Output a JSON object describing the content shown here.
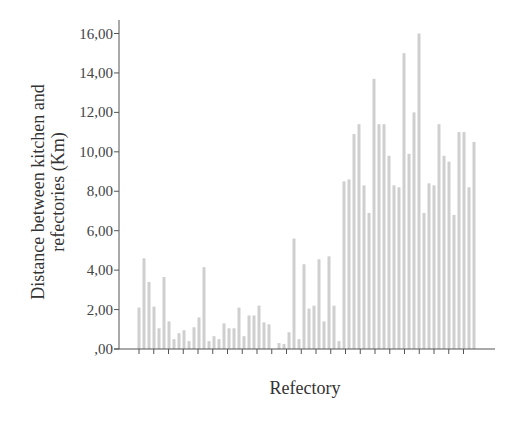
{
  "chart_data": {
    "type": "bar",
    "title": "",
    "xlabel": "Refectory",
    "ylabel_lines": [
      "Distance between kitchen and",
      "refectories (Km)"
    ],
    "ylabel": "Distance between kitchen and refectories (Km)",
    "ylim": [
      0,
      16
    ],
    "yticks": [
      0,
      2,
      4,
      6,
      8,
      10,
      12,
      14,
      16
    ],
    "ytick_labels": [
      ",00",
      "2,00",
      "4,00",
      "6,00",
      "8,00",
      "10,00",
      "12,00",
      "14,00",
      "16,00"
    ],
    "grid": false,
    "legend": null,
    "bar_color": "#cfcfcf",
    "categories_note": "individual refectories (unlabeled)",
    "values": [
      2.1,
      4.6,
      3.4,
      2.15,
      1.05,
      3.65,
      1.4,
      0.5,
      0.8,
      0.95,
      0.4,
      1.1,
      1.6,
      4.15,
      0.4,
      0.65,
      0.5,
      1.3,
      1.05,
      1.05,
      2.1,
      0.65,
      1.7,
      1.7,
      2.2,
      1.35,
      1.25,
      0,
      0.3,
      0.25,
      0.85,
      5.6,
      0.5,
      4.3,
      2.05,
      2.2,
      4.55,
      1.4,
      4.7,
      2.2,
      0.4,
      8.5,
      8.6,
      10.9,
      11.4,
      8.3,
      6.9,
      13.7,
      11.4,
      11.4,
      9.8,
      8.3,
      8.2,
      15.0,
      9.9,
      12.0,
      16.0,
      6.9,
      8.4,
      8.3,
      11.4,
      9.8,
      9.5,
      6.8,
      11.0,
      11.0,
      8.2,
      10.5
    ]
  }
}
